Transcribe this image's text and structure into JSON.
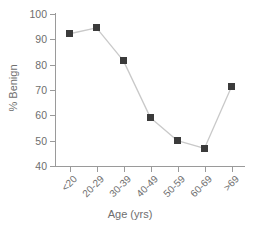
{
  "chart_data": {
    "type": "line",
    "title": "",
    "xlabel": "Age (yrs)",
    "ylabel": "% Benign",
    "categories": [
      "<20",
      "20-29",
      "30-39",
      "40-49",
      "50-59",
      "60-69",
      ">69"
    ],
    "values": [
      92.2,
      94.5,
      81.5,
      59.0,
      50.0,
      47.0,
      71.3
    ],
    "ylim": [
      40,
      100
    ],
    "yticks": [
      40,
      50,
      60,
      70,
      80,
      90,
      100
    ],
    "ytick_labels": [
      "40",
      "50",
      "60",
      "70",
      "80",
      "90",
      "100"
    ],
    "grid": false,
    "legend": null,
    "marker": "square",
    "marker_color": "#3b3b3b",
    "line_color": "#c9c9c9",
    "axis_color": "#9a9a9a",
    "text_color": "#6e6e6e",
    "background": "#ffffff",
    "xtick_label_rotation": -45
  }
}
